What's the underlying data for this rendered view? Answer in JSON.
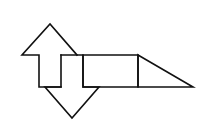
{
  "diagram": {
    "width": 200,
    "height": 126,
    "stroke_color": "#111111",
    "background": "#ffffff",
    "shapes": [
      {
        "name": "up-arrow",
        "points": "61,55 61,87 39,87 39,55 22,55 50,24 77,55"
      },
      {
        "name": "down-arrow",
        "points": "61,55 83,55 83,87 99,87 72,118 45,87 61,87"
      },
      {
        "name": "rectangle",
        "points": "83,55 138,55 138,87 83,87"
      },
      {
        "name": "right-triangle",
        "points": "138,55 193,87 138,87"
      }
    ]
  }
}
